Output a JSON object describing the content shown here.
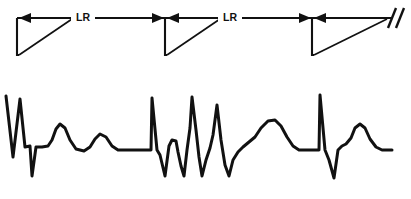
{
  "figure": {
    "width": 411,
    "height": 199,
    "background_color": "#ffffff",
    "ink_color": "#111111"
  },
  "ladder_diagram": {
    "name": "ladder-diagram",
    "description": "Three conduction triangles along a horizontal timeline with retrograde arrows and LR intervals",
    "baseline_y": 18,
    "labels": [
      {
        "text": "LR",
        "x": 82,
        "y": 18
      },
      {
        "text": "LR",
        "x": 229,
        "y": 18
      }
    ],
    "triangles": [
      {
        "name": "triangle-1",
        "apex_x": 17,
        "apex_y": 18,
        "bottom_x": 19,
        "bottom_y": 55,
        "hyp_top_x": 72,
        "hyp_top_y": 18
      },
      {
        "name": "triangle-2",
        "apex_x": 165,
        "apex_y": 18,
        "bottom_x": 167,
        "bottom_y": 55,
        "hyp_top_x": 220,
        "hyp_top_y": 18
      },
      {
        "name": "triangle-3",
        "apex_x": 312,
        "apex_y": 18,
        "bottom_x": 314,
        "bottom_y": 55,
        "hyp_top_x": 385,
        "hyp_top_y": 18
      }
    ],
    "arrows": [
      {
        "name": "arrow-left-1",
        "direction": "left",
        "tip_x": 20,
        "y": 18
      },
      {
        "name": "arrow-right-1",
        "direction": "right",
        "tip_x": 163,
        "y": 18
      },
      {
        "name": "arrow-left-2",
        "direction": "left",
        "tip_x": 168,
        "y": 18
      },
      {
        "name": "arrow-right-2",
        "direction": "right",
        "tip_x": 310,
        "y": 18
      },
      {
        "name": "arrow-left-3",
        "direction": "left",
        "tip_x": 315,
        "y": 18
      }
    ],
    "interruption_marker": {
      "name": "interruption-slashes",
      "count": 2,
      "x": 392,
      "y": 18
    }
  },
  "ecg_strip": {
    "name": "ecg-rhythm-strip",
    "baseline_y": 150,
    "beats": [
      {
        "name": "beat-1",
        "features": [
          "R-wave",
          "notch",
          "S-wave",
          "T-wave",
          "secondary-wave"
        ]
      },
      {
        "name": "beat-2",
        "features": [
          "R-wave",
          "S-wave",
          "R-prime",
          "S-prime",
          "R-double-prime",
          "S-double-prime",
          "T-wave"
        ]
      },
      {
        "name": "beat-3",
        "features": [
          "R-wave",
          "S-wave",
          "T-wave"
        ]
      }
    ],
    "path": "M 6,96 L 13,157 L 20,99 L 25,147 L 30,146 L 32,176 L 36,147 L 42,147 L 48,146 L 52,140 L 56,129 L 60,124 L 65,128 L 70,140 L 76,149 L 84,151 L 90,147 L 95,139 L 100,134 L 106,137 L 112,146 L 118,150 L 150,150 L 151,150 L 152,98 L 157,150 L 160,155 L 165,176 L 169,146 L 172,140 L 176,141 L 178,152 L 181,166 L 184,176 L 187,150 L 190,128 L 192,97 L 196,130 L 199,157 L 202,176 L 206,160 L 210,148 L 213,135 L 217,105 L 221,140 L 225,165 L 229,176 L 233,160 L 238,152 L 243,147 L 249,142 L 255,137 L 261,128 L 268,121 L 275,120 L 281,126 L 287,137 L 293,146 L 299,150 L 305,150 L 313,150 L 318,150 L 319,150 L 320,95 L 325,150 L 329,160 L 334,178 L 338,150 L 342,146 L 346,144 L 351,138 L 355,128 L 360,124 L 365,128 L 370,139 L 376,147 L 382,150 L 392,150"
  }
}
